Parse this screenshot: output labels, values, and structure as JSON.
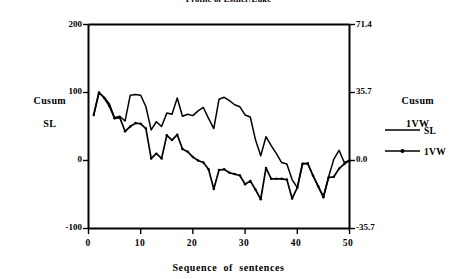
{
  "chart_data": {
    "type": "line",
    "title": "Profile of Esther/Luke",
    "xlabel": "Sequence  of  sentences",
    "ylabel_left": "Cusum\nSL",
    "ylabel_right": "Cusum\n1VW",
    "ylabel_left_line1": "Cusum",
    "ylabel_left_line2": "SL",
    "ylabel_right_line1": "Cusum",
    "ylabel_right_line2": "1VW",
    "grid": false,
    "legend_position": "right",
    "xlim": [
      0,
      50
    ],
    "ylim_left": [
      -100,
      200
    ],
    "ylim_right": [
      -35.7,
      71.4
    ],
    "xticks": [
      0,
      10,
      20,
      30,
      40,
      50
    ],
    "xtick_labels": [
      "0",
      "10",
      "20",
      "30",
      "40",
      "50"
    ],
    "yticks_left": [
      -100,
      0,
      100,
      200
    ],
    "ytick_labels_left": [
      "-100",
      "0",
      "100",
      "200"
    ],
    "yticks_right": [
      -35.7,
      0.0,
      35.7,
      71.4
    ],
    "ytick_labels_right": [
      "-35.7",
      "0.0",
      "35.7",
      "71.4"
    ],
    "x": [
      1,
      2,
      3,
      4,
      5,
      6,
      7,
      8,
      9,
      10,
      11,
      12,
      13,
      14,
      15,
      16,
      17,
      18,
      19,
      20,
      21,
      22,
      23,
      24,
      25,
      26,
      27,
      28,
      29,
      30,
      31,
      32,
      33,
      34,
      35,
      36,
      37,
      38,
      39,
      40,
      41,
      42,
      43,
      44,
      45,
      46,
      47,
      48,
      49,
      50
    ],
    "series": [
      {
        "name": "SL",
        "marker": "none",
        "color": "#000000",
        "values": [
          67,
          100,
          93,
          83,
          63,
          65,
          58,
          96,
          97,
          96,
          79,
          45,
          57,
          50,
          70,
          68,
          92,
          65,
          68,
          66,
          73,
          78,
          62,
          47,
          90,
          93,
          88,
          82,
          79,
          67,
          64,
          30,
          7,
          35,
          22,
          10,
          -3,
          -5,
          -28,
          -40,
          -4,
          -5,
          -22,
          -38,
          -53,
          -24,
          2,
          15,
          -3,
          0
        ]
      },
      {
        "name": "1VW",
        "marker": "dot",
        "color": "#000000",
        "values": [
          67,
          100,
          92,
          80,
          62,
          63,
          43,
          50,
          55,
          54,
          47,
          3,
          10,
          3,
          37,
          30,
          38,
          17,
          13,
          5,
          0,
          -3,
          -13,
          -42,
          -14,
          -13,
          -18,
          -20,
          -22,
          -35,
          -30,
          -43,
          -57,
          -11,
          -27,
          -27,
          -27,
          -28,
          -56,
          -40,
          -5,
          -4,
          -22,
          -38,
          -54,
          -25,
          -24,
          -12,
          -5,
          0
        ]
      }
    ]
  },
  "legend": {
    "items": [
      {
        "label": "SL",
        "marker": "none"
      },
      {
        "label": "1VW",
        "marker": "dot"
      }
    ]
  },
  "colors": {
    "line": "#000000",
    "axis": "#000000",
    "background": "#ffffff"
  }
}
